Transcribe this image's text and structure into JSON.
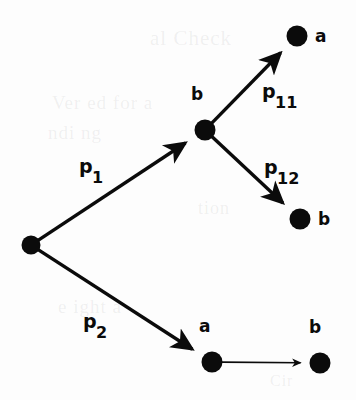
{
  "figure": {
    "background_color": "#fdfdfd",
    "ink_color": "#0b0b0b",
    "width": 356,
    "height": 400
  },
  "nodes": [
    {
      "id": "root",
      "label": "",
      "x": 31,
      "y": 245,
      "r": 9.5,
      "label_x": 0,
      "label_y": 0
    },
    {
      "id": "mid_b",
      "label": "b",
      "x": 205,
      "y": 130,
      "r": 10.5,
      "label_x": 191,
      "label_y": 86
    },
    {
      "id": "top_a",
      "label": "a",
      "x": 297,
      "y": 36,
      "r": 10.5,
      "label_x": 315,
      "label_y": 28
    },
    {
      "id": "right_b",
      "label": "b",
      "x": 300,
      "y": 219,
      "r": 10.5,
      "label_x": 318,
      "label_y": 211
    },
    {
      "id": "bot_a",
      "label": "a",
      "x": 212,
      "y": 362,
      "r": 10.5,
      "label_x": 199,
      "label_y": 318
    },
    {
      "id": "bot_b",
      "label": "b",
      "x": 320,
      "y": 363,
      "r": 10.5,
      "label_x": 309,
      "label_y": 319
    }
  ],
  "edges": [
    {
      "id": "e_p1",
      "from": "root",
      "to": "mid_b",
      "label_base": "p",
      "label_sub": "1",
      "label_x": 79,
      "label_y": 157,
      "width": 3.4,
      "arrow": "large"
    },
    {
      "id": "e_p11",
      "from": "mid_b",
      "to": "top_a",
      "label_base": "p",
      "label_sub": "11",
      "label_x": 262,
      "label_y": 82,
      "width": 3.4,
      "arrow": "large"
    },
    {
      "id": "e_p12",
      "from": "mid_b",
      "to": "right_b",
      "label_base": "p",
      "label_sub": "12",
      "label_x": 264,
      "label_y": 158,
      "width": 3.4,
      "arrow": "large"
    },
    {
      "id": "e_p2",
      "from": "root",
      "to": "bot_a",
      "label_base": "p",
      "label_sub": "2",
      "label_x": 83,
      "label_y": 312,
      "width": 3.4,
      "arrow": "large"
    },
    {
      "id": "e_ab",
      "from": "bot_a",
      "to": "bot_b",
      "label_base": "",
      "label_sub": "",
      "label_x": 0,
      "label_y": 0,
      "width": 1.6,
      "arrow": "small"
    }
  ],
  "background_artifacts": [
    {
      "text": "al Check",
      "x": 150,
      "y": 26,
      "size": 21
    },
    {
      "text": "Ver ed for a",
      "x": 52,
      "y": 92,
      "size": 19
    },
    {
      "text": "ndi ng",
      "x": 48,
      "y": 122,
      "size": 19
    },
    {
      "text": "tion",
      "x": 198,
      "y": 198,
      "size": 18
    },
    {
      "text": "e ight a",
      "x": 58,
      "y": 296,
      "size": 19
    },
    {
      "text": "Cir",
      "x": 270,
      "y": 372,
      "size": 16
    }
  ]
}
